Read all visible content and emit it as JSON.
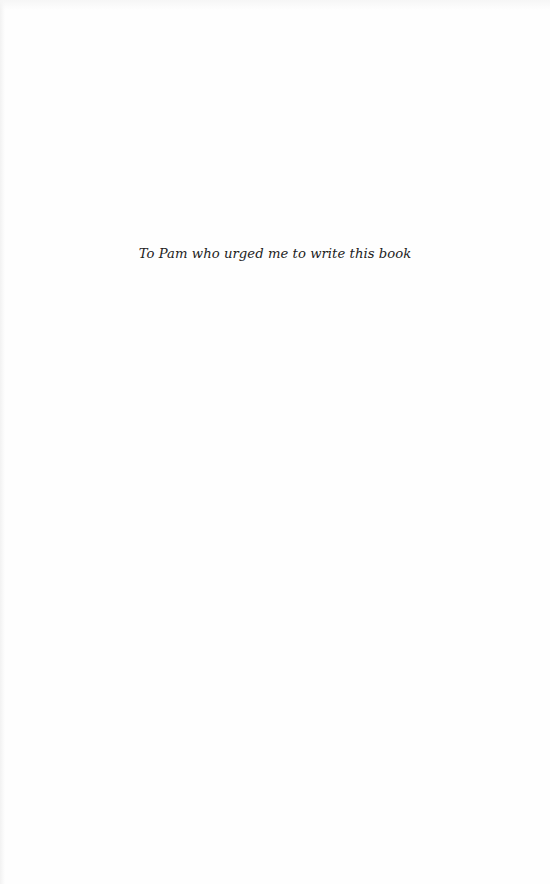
{
  "page": {
    "type": "dedication",
    "dedication_text": "To Pam who urged me to write this book"
  },
  "colors": {
    "background": "#fefefe",
    "text": "#222222"
  }
}
